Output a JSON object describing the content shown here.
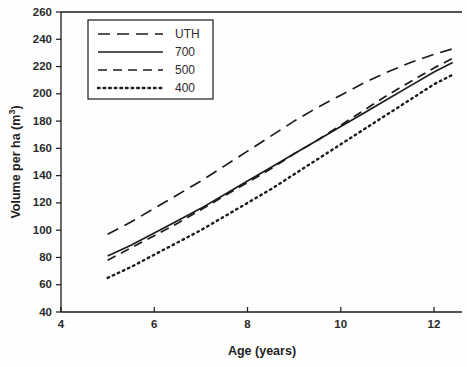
{
  "chart_data": {
    "type": "line",
    "title": "",
    "xlabel": "Age (years)",
    "ylabel": "Volume per ha (m3)",
    "ylabel_display": "Volume per ha (m",
    "ylabel_sup": "3",
    "ylabel_tail": ")",
    "xlim": [
      4,
      12.6
    ],
    "ylim": [
      40,
      260
    ],
    "xticks": [
      4,
      6,
      8,
      10,
      12
    ],
    "yticks": [
      40,
      60,
      80,
      100,
      120,
      140,
      160,
      180,
      200,
      220,
      240,
      260
    ],
    "xtick_labels": [
      "4",
      "6",
      "8",
      "10",
      "12"
    ],
    "ytick_labels": [
      "40",
      "60",
      "80",
      "100",
      "120",
      "140",
      "160",
      "180",
      "200",
      "220",
      "240",
      "260"
    ],
    "grid": false,
    "legend_position": "upper-left-inside",
    "x": [
      5,
      5.5,
      6,
      6.5,
      7,
      7.5,
      8,
      8.5,
      9,
      9.5,
      10,
      10.5,
      11,
      11.5,
      12,
      12.4
    ],
    "series": [
      {
        "name": "UTH",
        "style": "long-dash",
        "color": "#1c1c1c",
        "values": [
          97,
          106,
          116,
          126,
          136,
          147,
          158,
          169,
          180,
          190,
          199,
          208,
          216,
          223,
          229,
          233
        ]
      },
      {
        "name": "700",
        "style": "solid",
        "color": "#1c1c1c",
        "values": [
          81,
          89,
          98,
          107,
          116,
          126,
          136,
          146,
          156,
          166,
          176,
          186,
          196,
          206,
          216,
          223
        ]
      },
      {
        "name": "500",
        "style": "dash",
        "color": "#1c1c1c",
        "values": [
          78,
          87,
          96,
          105,
          115,
          125,
          135,
          145,
          156,
          166,
          177,
          188,
          199,
          209,
          219,
          226
        ]
      },
      {
        "name": "400",
        "style": "dotted",
        "color": "#1c1c1c",
        "values": [
          65,
          73,
          82,
          91,
          100,
          110,
          120,
          130,
          141,
          152,
          163,
          174,
          185,
          196,
          207,
          214
        ]
      }
    ],
    "legend_entries": [
      {
        "label": "UTH",
        "style": "long-dash"
      },
      {
        "label": "700",
        "style": "solid"
      },
      {
        "label": "500",
        "style": "dash"
      },
      {
        "label": "400",
        "style": "dotted"
      }
    ]
  }
}
